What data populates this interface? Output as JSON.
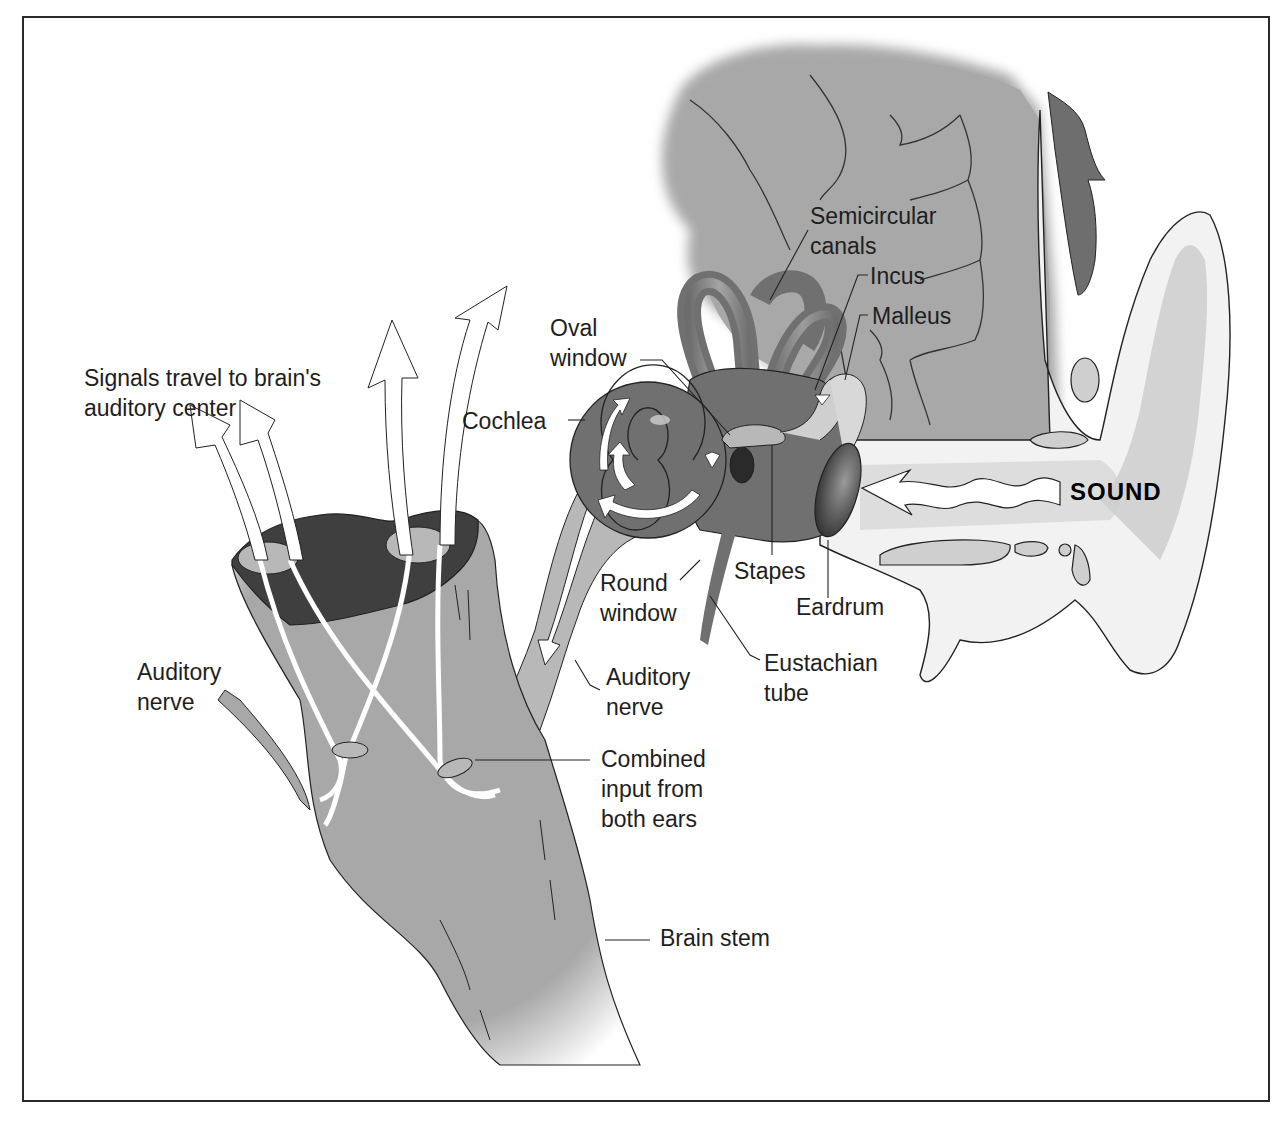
{
  "figure": {
    "type": "anatomical-diagram"
  },
  "colors": {
    "background": "#ffffff",
    "frame": "#2a2a2a",
    "brain_gray": "#a8a8a8",
    "structure_dark": "#707070",
    "cut_section": "#3f3f3f",
    "ear_light": "#f2f2f2",
    "cartilage": "#cfcfcf",
    "arrow_fill": "#ffffff",
    "text": "#1e1e1e"
  },
  "labels": {
    "signals": {
      "line1": "Signals travel to brain's",
      "line2": "auditory center"
    },
    "auditory_nerve_left": {
      "line1": "Auditory",
      "line2": "nerve"
    },
    "oval_window": {
      "line1": "Oval",
      "line2": "window"
    },
    "cochlea": {
      "line1": "Cochlea"
    },
    "semicircular_canals": {
      "line1": "Semicircular",
      "line2": "canals"
    },
    "incus": {
      "line1": "Incus"
    },
    "malleus": {
      "line1": "Malleus"
    },
    "sound": {
      "line1": "SOUND"
    },
    "round_window": {
      "line1": "Round",
      "line2": "window"
    },
    "stapes": {
      "line1": "Stapes"
    },
    "eardrum": {
      "line1": "Eardrum"
    },
    "auditory_nerve_right": {
      "line1": "Auditory",
      "line2": "nerve"
    },
    "eustachian_tube": {
      "line1": "Eustachian",
      "line2": "tube"
    },
    "combined_input": {
      "line1": "Combined",
      "line2": "input from",
      "line3": "both ears"
    },
    "brain_stem": {
      "line1": "Brain stem"
    }
  }
}
